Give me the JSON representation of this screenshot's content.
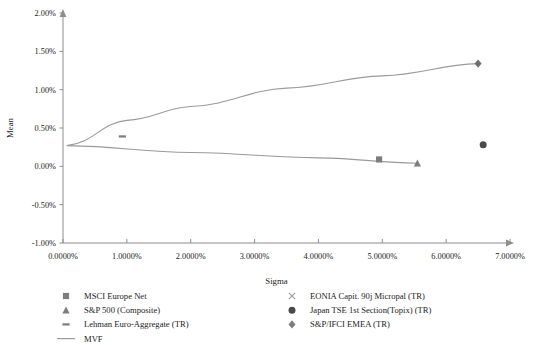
{
  "chart_data": {
    "type": "scatter",
    "title": "",
    "xlabel": "Sigma",
    "ylabel": "Mean",
    "xlim": [
      0,
      7
    ],
    "ylim": [
      -1,
      2
    ],
    "xticks": [
      "0.0000%",
      "1.0000%",
      "2.0000%",
      "3.0000%",
      "4.0000%",
      "5.0000%",
      "6.0000%",
      "7.0000%"
    ],
    "xtick_values": [
      0,
      1,
      2,
      3,
      4,
      5,
      6,
      7
    ],
    "yticks": [
      "2.00%",
      "1.50%",
      "1.00%",
      "0.50%",
      "0.00%",
      "-0.50%",
      "-1.00%"
    ],
    "ytick_values": [
      2,
      1.5,
      1,
      0.5,
      0,
      -0.5,
      -1
    ],
    "grid": false,
    "legend_position": "bottom",
    "series": [
      {
        "name": "MSCI Europe Net",
        "marker": "square",
        "color": "#7d7d7d",
        "points": [
          {
            "x": 4.95,
            "y": 0.09
          }
        ]
      },
      {
        "name": "S&P 500 (Composite)",
        "marker": "triangle",
        "color": "#7d7d7d",
        "points": [
          {
            "x": 5.55,
            "y": 0.04
          }
        ]
      },
      {
        "name": "Lehman Euro-Aggregate (TR)",
        "marker": "dash",
        "color": "#7d7d7d",
        "points": [
          {
            "x": 0.93,
            "y": 0.39
          }
        ]
      },
      {
        "name": "MVF",
        "marker": "line",
        "color": "#9a9a9a",
        "upper_branch": [
          {
            "x": 0.06,
            "y": 0.27
          },
          {
            "x": 1.0,
            "y": 0.6
          },
          {
            "x": 2.0,
            "y": 0.78
          },
          {
            "x": 3.5,
            "y": 1.02
          },
          {
            "x": 5.0,
            "y": 1.18
          },
          {
            "x": 6.5,
            "y": 1.34
          }
        ],
        "lower_branch": [
          {
            "x": 0.06,
            "y": 0.27
          },
          {
            "x": 2.0,
            "y": 0.18
          },
          {
            "x": 4.0,
            "y": 0.11
          },
          {
            "x": 5.55,
            "y": 0.04
          }
        ]
      },
      {
        "name": "EONIA Capit. 90j Micropal (TR)",
        "marker": "cross",
        "color": "#9a9a9a",
        "points": []
      },
      {
        "name": "Japan TSE 1st Section(Topix) (TR)",
        "marker": "circle",
        "color": "#4a4a4a",
        "points": [
          {
            "x": 6.58,
            "y": 0.28
          }
        ]
      },
      {
        "name": "S&P/IFCI EMEA (TR)",
        "marker": "diamond",
        "color": "#6e6e6e",
        "points": [
          {
            "x": 6.5,
            "y": 1.34
          }
        ]
      }
    ]
  },
  "axes": {
    "x_title": "Sigma",
    "y_title": "Mean",
    "y_labels": [
      "2.00%",
      "1.50%",
      "1.00%",
      "0.50%",
      "0.00%",
      "-0.50%",
      "-1.00%"
    ],
    "x_labels": [
      "0.0000%",
      "1.0000%",
      "2.0000%",
      "3.0000%",
      "4.0000%",
      "5.0000%",
      "6.0000%",
      "7.0000%"
    ]
  },
  "legend": {
    "column_left": [
      {
        "label": "MSCI Europe Net",
        "marker": "square"
      },
      {
        "label": "S&P 500 (Composite)",
        "marker": "triangle"
      },
      {
        "label": "Lehman Euro-Aggregate (TR)",
        "marker": "dash"
      },
      {
        "label": "MVF",
        "marker": "line"
      }
    ],
    "column_right": [
      {
        "label": "EONIA Capit. 90j Micropal (TR)",
        "marker": "cross"
      },
      {
        "label": "Japan TSE 1st Section(Topix) (TR)",
        "marker": "circle"
      },
      {
        "label": "S&P/IFCI EMEA (TR)",
        "marker": "diamond"
      }
    ]
  },
  "colors": {
    "axis": "#8d8d8d",
    "frontier": "#9a9a9a",
    "marker_gray": "#7d7d7d",
    "marker_dark": "#4a4a4a",
    "text": "#1b1b1b",
    "background": "#ffffff"
  }
}
